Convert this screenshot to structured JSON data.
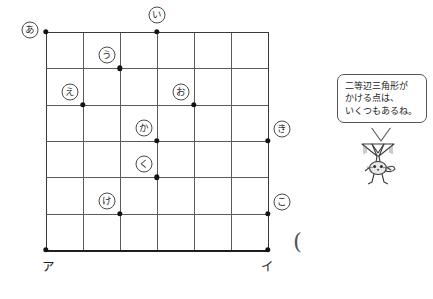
{
  "figure": {
    "type": "lattice-grid-geometry",
    "grid": {
      "columns": 6,
      "rows": 6,
      "origin_label": "ア",
      "end_label": "イ"
    },
    "corner_labels": [
      {
        "name": "bottom-left-vertex",
        "text": "ア",
        "x": 46,
        "y": 250
      },
      {
        "name": "bottom-right-vertex",
        "text": "イ",
        "x": 268,
        "y": 250
      }
    ],
    "points": [
      {
        "id": "a",
        "text": "あ",
        "col": 0,
        "row": 0,
        "label_dx": -16,
        "label_dy": -2
      },
      {
        "id": "i",
        "text": "い",
        "col": 3,
        "row": 0,
        "label_dx": 0,
        "label_dy": -17
      },
      {
        "id": "u",
        "text": "う",
        "col": 2,
        "row": 1,
        "label_dx": -13,
        "label_dy": -13
      },
      {
        "id": "e",
        "text": "え",
        "col": 1,
        "row": 2,
        "label_dx": -13,
        "label_dy": -13
      },
      {
        "id": "o",
        "text": "お",
        "col": 4,
        "row": 2,
        "label_dx": -13,
        "label_dy": -13
      },
      {
        "id": "ka",
        "text": "か",
        "col": 3,
        "row": 3,
        "label_dx": -13,
        "label_dy": -13
      },
      {
        "id": "ki",
        "text": "き",
        "col": 6,
        "row": 3,
        "label_dx": 14,
        "label_dy": -12
      },
      {
        "id": "ku",
        "text": "く",
        "col": 3,
        "row": 4,
        "label_dx": -13,
        "label_dy": -13
      },
      {
        "id": "ke",
        "text": "け",
        "col": 2,
        "row": 5,
        "label_dx": -13,
        "label_dy": -13
      },
      {
        "id": "ko",
        "text": "こ",
        "col": 6,
        "row": 5,
        "label_dx": 14,
        "label_dy": -12
      }
    ],
    "stray_mark": {
      "text": "(",
      "x": 293,
      "y": 228
    }
  },
  "speech_bubble": {
    "lines": [
      "二等辺三角形が",
      "かける点は、",
      "いくつもあるね。"
    ]
  },
  "colors": {
    "grid_line": "#5a5a5a",
    "grid_edge": "#3a3a3a",
    "baseline": "#1e1e1e",
    "dot": "#141414",
    "text": "#1c1c1c",
    "bubble_border": "#555555",
    "background": "#ffffff"
  }
}
